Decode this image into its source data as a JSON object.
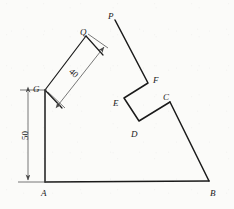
{
  "figure": {
    "type": "line-drawing",
    "width": 234,
    "height": 209,
    "background_color": "#fbfbf9",
    "stroke_color": "#1a1a1a",
    "dimension_stroke_color": "#555555",
    "vertex_labels": [
      {
        "id": "A",
        "text": "A",
        "x": 41,
        "y": 189
      },
      {
        "id": "B",
        "text": "B",
        "x": 210,
        "y": 189
      },
      {
        "id": "C",
        "text": "C",
        "x": 163,
        "y": 93
      },
      {
        "id": "D",
        "text": "D",
        "x": 131,
        "y": 130
      },
      {
        "id": "E",
        "text": "E",
        "x": 113,
        "y": 99
      },
      {
        "id": "F",
        "text": "F",
        "x": 153,
        "y": 76
      },
      {
        "id": "G",
        "text": "G",
        "x": 33,
        "y": 85
      },
      {
        "id": "P",
        "text": "P",
        "x": 108,
        "y": 12
      },
      {
        "id": "Q",
        "text": "Q",
        "x": 80,
        "y": 28
      }
    ],
    "dimensions": [
      {
        "id": "dim-50",
        "value": "50",
        "orientation": "vertical",
        "label_x": 21,
        "label_y": 131
      },
      {
        "id": "dim-40",
        "value": "40",
        "orientation": "oblique-42",
        "label_x": 69,
        "label_y": 69
      }
    ],
    "vertices": {
      "A": {
        "x": 45,
        "y": 182
      },
      "B": {
        "x": 209,
        "y": 181
      },
      "C": {
        "x": 170,
        "y": 102
      },
      "D": {
        "x": 139,
        "y": 121
      },
      "E": {
        "x": 124,
        "y": 98
      },
      "F": {
        "x": 148,
        "y": 83
      },
      "P": {
        "x": 115,
        "y": 20
      },
      "G": {
        "x": 45,
        "y": 90
      },
      "Q": {
        "x": 86,
        "y": 36
      },
      "R": {
        "x": 103,
        "y": 55
      },
      "S": {
        "x": 62,
        "y": 108
      }
    },
    "edges": [
      {
        "from": "A",
        "to": "B",
        "name": "edge-A-B"
      },
      {
        "from": "A",
        "to": "G",
        "name": "edge-A-G"
      },
      {
        "from": "G",
        "to": "Q",
        "name": "edge-G-Q"
      },
      {
        "from": "Q",
        "to": "R",
        "name": "edge-Q-R"
      },
      {
        "from": "G",
        "to": "S",
        "name": "edge-G-S"
      },
      {
        "from": "P",
        "to": "F",
        "name": "edge-P-F"
      },
      {
        "from": "F",
        "to": "E",
        "name": "edge-F-E"
      },
      {
        "from": "E",
        "to": "D",
        "name": "edge-E-D"
      },
      {
        "from": "D",
        "to": "C",
        "name": "edge-D-C"
      },
      {
        "from": "C",
        "to": "B",
        "name": "edge-C-B"
      }
    ]
  }
}
